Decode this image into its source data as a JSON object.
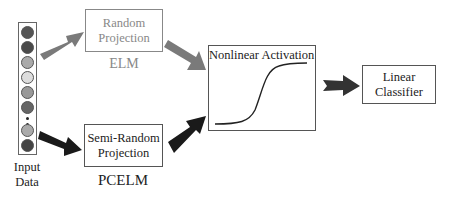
{
  "input": {
    "label_line1": "Input",
    "label_line2": "Data",
    "circles": [
      {
        "color": "#555555"
      },
      {
        "color": "#4a4a4a"
      },
      {
        "color": "#aaaaaa"
      },
      {
        "color": "#dddddd"
      },
      {
        "color": "#999999"
      },
      {
        "color": "#666666"
      },
      {
        "color": "#aaaaaa"
      },
      {
        "color": "#444444"
      }
    ]
  },
  "elm": {
    "box_line1": "Random",
    "box_line2": "Projection",
    "caption": "ELM"
  },
  "pcelm": {
    "box_line1": "Semi-Random",
    "box_line2": "Projection",
    "caption": "PCELM"
  },
  "activation": {
    "title": "Nonlinear Activation"
  },
  "classifier": {
    "line1": "Linear",
    "line2": "Classifier"
  },
  "colors": {
    "elm_arrow": "#777777",
    "pcelm_arrow": "#1a1a1a",
    "output_arrow": "#333333",
    "faded_text": "#888888"
  }
}
